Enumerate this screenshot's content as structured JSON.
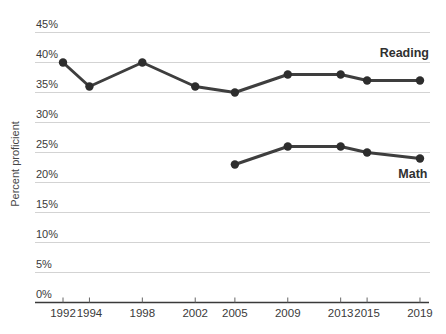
{
  "chart_data": {
    "type": "line",
    "title": "",
    "ylabel": "Percent proficient",
    "xlabel": "",
    "xlim": [
      1989.9,
      2019.8
    ],
    "ylim": [
      0,
      45
    ],
    "grid": true,
    "y_ticks": [
      45,
      40,
      35,
      30,
      25,
      20,
      15,
      10,
      5,
      0
    ],
    "y_tick_suffix": "%",
    "x_ticks": [
      1992,
      1994,
      1998,
      2002,
      2005,
      2009,
      2013,
      2015,
      2019
    ],
    "legend_position": "end-of-line-labels",
    "series": [
      {
        "name": "Reading",
        "x": [
          1992,
          1994,
          1998,
          2002,
          2005,
          2009,
          2013,
          2015,
          2019
        ],
        "values": [
          40,
          36,
          40,
          36,
          35,
          38,
          38,
          37,
          37
        ]
      },
      {
        "name": "Math",
        "x": [
          2005,
          2009,
          2013,
          2015,
          2019
        ],
        "values": [
          23,
          26,
          26,
          25,
          24
        ]
      }
    ],
    "colors": {
      "line": "#3e3e3e",
      "point": "#2d2d2d",
      "gridline": "#d3d3d3",
      "axis": "#3a3a3a",
      "tick": "#666666",
      "text": "#3a3a3a"
    }
  }
}
